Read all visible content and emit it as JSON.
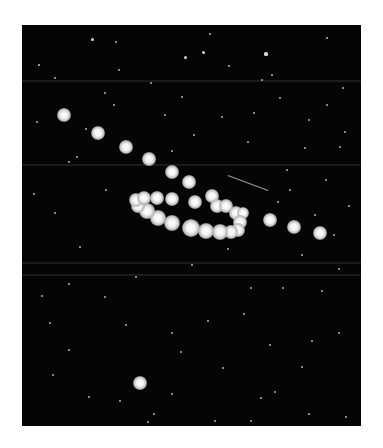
{
  "image": {
    "subject": "Retrograde loop of a planet photographed against a star field",
    "frame": {
      "x": 22,
      "y": 25,
      "width": 339,
      "height": 401
    },
    "colors": {
      "background": "#ffffff",
      "sky": "#050505",
      "star": "#e8e8e8"
    }
  },
  "bands": [
    55,
    139,
    237,
    249
  ],
  "planet_positions": [
    {
      "x": 42,
      "y": 90,
      "r": 5
    },
    {
      "x": 76,
      "y": 108,
      "r": 5
    },
    {
      "x": 104,
      "y": 122,
      "r": 5
    },
    {
      "x": 127,
      "y": 134,
      "r": 5
    },
    {
      "x": 150,
      "y": 147,
      "r": 5
    },
    {
      "x": 167,
      "y": 157,
      "r": 5
    },
    {
      "x": 190,
      "y": 171,
      "r": 5
    },
    {
      "x": 195,
      "y": 181,
      "r": 5
    },
    {
      "x": 204,
      "y": 181,
      "r": 5
    },
    {
      "x": 214,
      "y": 188,
      "r": 5
    },
    {
      "x": 221,
      "y": 188,
      "r": 4
    },
    {
      "x": 218,
      "y": 197,
      "r": 5
    },
    {
      "x": 216,
      "y": 205,
      "r": 5
    },
    {
      "x": 209,
      "y": 207,
      "r": 5
    },
    {
      "x": 198,
      "y": 207,
      "r": 6
    },
    {
      "x": 184,
      "y": 206,
      "r": 6
    },
    {
      "x": 169,
      "y": 203,
      "r": 7
    },
    {
      "x": 150,
      "y": 198,
      "r": 6
    },
    {
      "x": 136,
      "y": 193,
      "r": 6
    },
    {
      "x": 125,
      "y": 186,
      "r": 6
    },
    {
      "x": 116,
      "y": 181,
      "r": 5
    },
    {
      "x": 114,
      "y": 175,
      "r": 5
    },
    {
      "x": 122,
      "y": 173,
      "r": 5
    },
    {
      "x": 135,
      "y": 173,
      "r": 5
    },
    {
      "x": 150,
      "y": 174,
      "r": 5
    },
    {
      "x": 173,
      "y": 177,
      "r": 5
    },
    {
      "x": 248,
      "y": 195,
      "r": 5
    },
    {
      "x": 272,
      "y": 202,
      "r": 5
    },
    {
      "x": 298,
      "y": 208,
      "r": 5
    },
    {
      "x": 118,
      "y": 358,
      "r": 5
    }
  ],
  "streak": {
    "x1": 206,
    "y1": 150,
    "x2": 246,
    "y2": 165
  },
  "stars": [
    [
      70,
      14,
      1.5
    ],
    [
      188,
      9,
      1.2
    ],
    [
      17,
      40,
      1.3
    ],
    [
      94,
      17,
      1.1
    ],
    [
      163,
      32,
      1.5
    ],
    [
      181,
      27,
      1.5
    ],
    [
      244,
      29,
      1.6
    ],
    [
      250,
      50,
      1.1
    ],
    [
      305,
      13,
      1.2
    ],
    [
      97,
      45,
      1
    ],
    [
      207,
      41,
      1
    ],
    [
      258,
      73,
      1
    ],
    [
      305,
      80,
      1
    ],
    [
      33,
      53,
      1
    ],
    [
      129,
      58,
      1
    ],
    [
      83,
      68,
      0.9
    ],
    [
      240,
      55,
      1
    ],
    [
      160,
      72,
      1
    ],
    [
      321,
      63,
      1
    ],
    [
      200,
      92,
      1
    ],
    [
      287,
      95,
      1
    ],
    [
      64,
      104,
      1
    ],
    [
      15,
      97,
      0.9
    ],
    [
      323,
      107,
      1
    ],
    [
      283,
      123,
      1
    ],
    [
      226,
      117,
      1
    ],
    [
      55,
      132,
      1.1
    ],
    [
      47,
      137,
      1
    ],
    [
      318,
      122,
      1
    ],
    [
      265,
      145,
      1
    ],
    [
      304,
      155,
      1
    ],
    [
      12,
      169,
      1
    ],
    [
      256,
      177,
      1
    ],
    [
      293,
      190,
      1.1
    ],
    [
      312,
      210,
      1
    ],
    [
      327,
      181,
      1
    ],
    [
      280,
      230,
      1
    ],
    [
      261,
      263,
      1
    ],
    [
      317,
      244,
      1
    ],
    [
      300,
      266,
      1
    ],
    [
      47,
      259,
      1.2
    ],
    [
      20,
      271,
      1.1
    ],
    [
      83,
      272,
      1
    ],
    [
      28,
      298,
      1
    ],
    [
      104,
      300,
      1
    ],
    [
      150,
      308,
      1
    ],
    [
      186,
      296,
      1
    ],
    [
      222,
      289,
      1
    ],
    [
      248,
      320,
      1.1
    ],
    [
      290,
      316,
      1
    ],
    [
      317,
      308,
      1
    ],
    [
      47,
      325,
      1
    ],
    [
      159,
      327,
      1
    ],
    [
      201,
      343,
      1
    ],
    [
      280,
      342,
      1
    ],
    [
      31,
      350,
      1
    ],
    [
      239,
      373,
      1
    ],
    [
      287,
      389,
      1.2
    ],
    [
      324,
      392,
      1
    ],
    [
      132,
      389,
      1.1
    ],
    [
      126,
      397,
      1
    ],
    [
      193,
      396,
      1
    ],
    [
      253,
      367,
      1
    ],
    [
      67,
      372,
      1
    ],
    [
      98,
      376,
      1
    ],
    [
      150,
      369,
      1
    ],
    [
      229,
      396,
      1
    ],
    [
      58,
      222,
      1
    ],
    [
      114,
      252,
      1
    ],
    [
      170,
      240,
      1
    ],
    [
      206,
      224,
      1
    ],
    [
      143,
      90,
      1
    ],
    [
      92,
      80,
      1
    ],
    [
      172,
      110,
      1
    ],
    [
      232,
      88,
      1
    ],
    [
      150,
      126,
      1
    ],
    [
      268,
      165,
      1
    ],
    [
      33,
      188,
      1
    ],
    [
      84,
      165,
      1
    ],
    [
      229,
      263,
      1
    ]
  ]
}
